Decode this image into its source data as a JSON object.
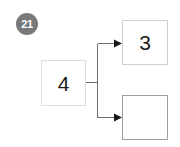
{
  "badge": {
    "label": "21"
  },
  "diagram": {
    "nodes": [
      {
        "id": "source",
        "label": "4"
      },
      {
        "id": "target_top",
        "label": "3"
      },
      {
        "id": "target_bottom",
        "label": ""
      }
    ],
    "edges": [
      {
        "from": "source",
        "to": "target_top",
        "arrow": "right"
      },
      {
        "from": "source",
        "to": "target_bottom",
        "arrow": "right"
      }
    ]
  },
  "colors": {
    "badge_fill": "#797979",
    "badge_text": "#ffffff",
    "node_border_light": "#dcdcdc",
    "node_border_dark": "#9e9e9e",
    "connector": "#6e6e6e",
    "text": "#1a1a1a",
    "background": "#ffffff"
  }
}
